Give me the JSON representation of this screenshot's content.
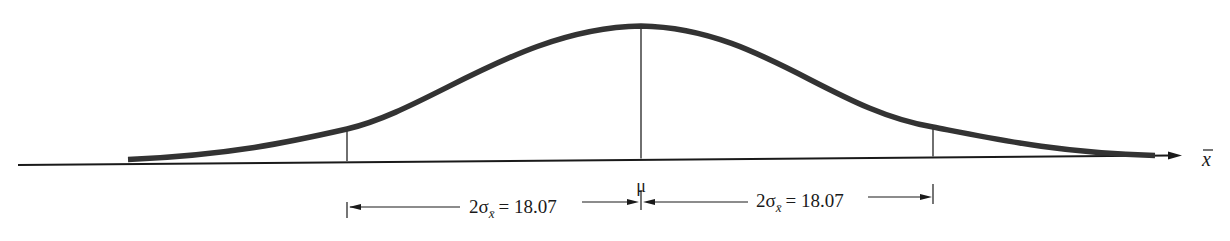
{
  "diagram": {
    "type": "normal-curve",
    "axis_label": "x̄",
    "center_label": "μ",
    "left_interval": {
      "prefix": "2σ",
      "subscript": "x̄",
      "equals": "= 18.07"
    },
    "right_interval": {
      "prefix": "2σ",
      "subscript": "x̄",
      "equals": "= 18.07"
    },
    "colors": {
      "curve": "#333333",
      "axis": "#1a1a1a",
      "text": "#1a1a1a"
    }
  }
}
